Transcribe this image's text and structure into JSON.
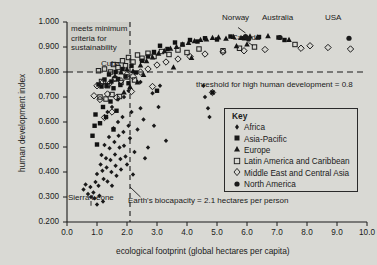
{
  "chart_data": {
    "type": "scatter",
    "title": "",
    "xlabel": "ecological footprint (global hectares per capita)",
    "ylabel": "human development index",
    "xlim": [
      0.0,
      10.0
    ],
    "ylim": [
      0.2,
      1.0
    ],
    "xticks": [
      "0.0",
      "1.0",
      "2.0",
      "3.0",
      "4.0",
      "5.0",
      "6.0",
      "7.0",
      "8.0",
      "9.0",
      "10.0"
    ],
    "yticks": [
      "1.000",
      "0.900",
      "0.800",
      "0.700",
      "0.600",
      "0.500",
      "0.400",
      "0.300",
      "0.200"
    ],
    "grid": false,
    "legend_position": "inside-bottom-right",
    "legend_title": "Key",
    "reference_lines": [
      {
        "name": "hdi-threshold",
        "orientation": "horizontal",
        "value": 0.8,
        "style": "dashed",
        "label": "threshold for high human development = 0.8"
      },
      {
        "name": "biocapacity",
        "orientation": "vertical",
        "value": 2.1,
        "style": "dashed",
        "label": "Earth's biocapacity = 2.1 hectares per person"
      }
    ],
    "annotations": [
      {
        "name": "sustainability-quadrant",
        "text": "meets minimum criteria for sustainability",
        "lines": [
          "meets minimum",
          "criteria for",
          "sustainability"
        ]
      },
      {
        "name": "cuba-callout",
        "text": "Cuba"
      },
      {
        "name": "sierra-leone-callout",
        "text": "Sierra Leone"
      },
      {
        "name": "norway-callout",
        "text": "Norway"
      },
      {
        "name": "canada-callout",
        "text": "Canada"
      },
      {
        "name": "australia-callout",
        "text": "Australia"
      },
      {
        "name": "usa-callout",
        "text": "USA"
      }
    ],
    "series": [
      {
        "name": "Africa",
        "marker": "small-diamond",
        "color": "#1a1a1a",
        "points": [
          [
            0.55,
            0.33
          ],
          [
            0.62,
            0.35
          ],
          [
            0.7,
            0.312
          ],
          [
            0.78,
            0.34
          ],
          [
            0.8,
            0.3
          ],
          [
            0.88,
            0.318
          ],
          [
            0.95,
            0.36
          ],
          [
            1.0,
            0.392
          ],
          [
            1.05,
            0.345
          ],
          [
            1.08,
            0.305
          ],
          [
            1.12,
            0.43
          ],
          [
            1.15,
            0.468
          ],
          [
            1.18,
            0.405
          ],
          [
            1.22,
            0.372
          ],
          [
            1.25,
            0.508
          ],
          [
            1.3,
            0.455
          ],
          [
            1.32,
            0.418
          ],
          [
            1.35,
            0.362
          ],
          [
            1.4,
            0.54
          ],
          [
            1.42,
            0.495
          ],
          [
            1.45,
            0.448
          ],
          [
            1.48,
            0.4
          ],
          [
            1.5,
            0.345
          ],
          [
            1.55,
            0.575
          ],
          [
            1.58,
            0.52
          ],
          [
            1.6,
            0.47
          ],
          [
            1.62,
            0.425
          ],
          [
            1.65,
            0.385
          ],
          [
            1.7,
            0.6
          ],
          [
            1.72,
            0.545
          ],
          [
            1.75,
            0.498
          ],
          [
            1.78,
            0.452
          ],
          [
            1.8,
            0.41
          ],
          [
            1.85,
            0.62
          ],
          [
            1.88,
            0.56
          ],
          [
            1.9,
            0.505
          ],
          [
            1.95,
            0.462
          ],
          [
            2.0,
            0.43
          ],
          [
            2.05,
            0.585
          ],
          [
            2.1,
            0.535
          ],
          [
            2.15,
            0.64
          ],
          [
            2.25,
            0.48
          ],
          [
            2.35,
            0.57
          ],
          [
            2.45,
            0.655
          ],
          [
            2.55,
            0.61
          ],
          [
            2.7,
            0.498
          ],
          [
            2.9,
            0.585
          ],
          [
            3.05,
            0.66
          ],
          [
            1.2,
            0.282
          ],
          [
            1.0,
            0.27
          ],
          [
            0.92,
            0.295
          ],
          [
            2.2,
            0.39
          ],
          [
            2.6,
            0.455
          ],
          [
            3.3,
            0.525
          ],
          [
            4.6,
            0.7
          ],
          [
            4.7,
            0.655
          ],
          [
            4.75,
            0.62
          ],
          [
            2.85,
            0.715
          ],
          [
            3.1,
            0.745
          ],
          [
            2.45,
            0.76
          ],
          [
            1.35,
            0.64
          ],
          [
            1.5,
            0.66
          ],
          [
            1.7,
            0.69
          ],
          [
            1.9,
            0.7
          ],
          [
            2.05,
            0.725
          ],
          [
            4.55,
            0.745
          ]
        ]
      },
      {
        "name": "Asia-Pacific",
        "marker": "filled-square",
        "color": "#111111",
        "points": [
          [
            1.05,
            0.75
          ],
          [
            1.15,
            0.742
          ],
          [
            1.25,
            0.77
          ],
          [
            1.32,
            0.745
          ],
          [
            1.4,
            0.79
          ],
          [
            1.48,
            0.762
          ],
          [
            1.55,
            0.735
          ],
          [
            1.62,
            0.8
          ],
          [
            1.7,
            0.772
          ],
          [
            1.78,
            0.748
          ],
          [
            1.85,
            0.812
          ],
          [
            1.95,
            0.782
          ],
          [
            2.05,
            0.755
          ],
          [
            2.15,
            0.825
          ],
          [
            2.3,
            0.798
          ],
          [
            2.5,
            0.845
          ],
          [
            2.7,
            0.862
          ],
          [
            2.9,
            0.88
          ],
          [
            3.1,
            0.905
          ],
          [
            3.35,
            0.892
          ],
          [
            3.6,
            0.918
          ],
          [
            3.85,
            0.91
          ],
          [
            4.1,
            0.928
          ],
          [
            4.35,
            0.922
          ],
          [
            4.6,
            0.935
          ],
          [
            5.0,
            0.93
          ],
          [
            5.45,
            0.942
          ],
          [
            5.9,
            0.935
          ],
          [
            6.4,
            0.94
          ],
          [
            7.05,
            0.938
          ],
          [
            7.25,
            0.928
          ],
          [
            0.95,
            0.63
          ],
          [
            1.1,
            0.595
          ],
          [
            1.2,
            0.66
          ],
          [
            1.3,
            0.62
          ],
          [
            1.45,
            0.682
          ],
          [
            1.55,
            0.57
          ],
          [
            1.65,
            0.645
          ],
          [
            0.85,
            0.545
          ],
          [
            0.92,
            0.585
          ],
          [
            1.0,
            0.51
          ],
          [
            4.85,
            0.718
          ],
          [
            3.0,
            0.725
          ]
        ]
      },
      {
        "name": "Europe",
        "marker": "filled-triangle",
        "color": "#141414",
        "points": [
          [
            1.6,
            0.785
          ],
          [
            1.8,
            0.8
          ],
          [
            2.0,
            0.812
          ],
          [
            2.2,
            0.805
          ],
          [
            2.45,
            0.828
          ],
          [
            2.65,
            0.845
          ],
          [
            2.85,
            0.86
          ],
          [
            3.05,
            0.875
          ],
          [
            3.25,
            0.885
          ],
          [
            3.45,
            0.895
          ],
          [
            3.65,
            0.902
          ],
          [
            3.85,
            0.912
          ],
          [
            4.05,
            0.918
          ],
          [
            4.25,
            0.925
          ],
          [
            4.45,
            0.93
          ],
          [
            4.65,
            0.932
          ],
          [
            4.85,
            0.938
          ],
          [
            5.05,
            0.94
          ],
          [
            5.3,
            0.935
          ],
          [
            5.55,
            0.942
          ],
          [
            5.8,
            0.938
          ],
          [
            6.1,
            0.944
          ],
          [
            6.35,
            0.94
          ],
          [
            6.7,
            0.945
          ],
          [
            7.4,
            0.93
          ],
          [
            2.35,
            0.76
          ],
          [
            2.1,
            0.742
          ],
          [
            1.9,
            0.72
          ],
          [
            5.65,
            0.905
          ],
          [
            6.0,
            0.912
          ],
          [
            4.15,
            0.858
          ],
          [
            3.55,
            0.82
          ],
          [
            2.55,
            0.79
          ]
        ]
      },
      {
        "name": "Latin America and Caribbean",
        "marker": "open-square",
        "color": "#1a1a1a",
        "points": [
          [
            1.05,
            0.805
          ],
          [
            1.25,
            0.812
          ],
          [
            1.45,
            0.8
          ],
          [
            1.55,
            0.83
          ],
          [
            1.7,
            0.818
          ],
          [
            1.85,
            0.845
          ],
          [
            1.95,
            0.825
          ],
          [
            2.05,
            0.858
          ],
          [
            2.2,
            0.84
          ],
          [
            2.35,
            0.868
          ],
          [
            2.5,
            0.855
          ],
          [
            2.7,
            0.875
          ],
          [
            2.9,
            0.862
          ],
          [
            3.15,
            0.882
          ],
          [
            3.4,
            0.87
          ],
          [
            3.7,
            0.888
          ],
          [
            4.0,
            0.878
          ],
          [
            4.4,
            0.892
          ],
          [
            5.2,
            0.885
          ],
          [
            5.75,
            0.895
          ],
          [
            1.15,
            0.762
          ],
          [
            1.35,
            0.745
          ],
          [
            1.6,
            0.772
          ],
          [
            1.8,
            0.758
          ],
          [
            2.0,
            0.78
          ],
          [
            2.25,
            0.768
          ],
          [
            1.1,
            0.7
          ],
          [
            1.3,
            0.692
          ],
          [
            1.5,
            0.71
          ],
          [
            1.75,
            0.702
          ],
          [
            6.25,
            0.9
          ],
          [
            7.6,
            0.91
          ]
        ]
      },
      {
        "name": "Middle East and Central Asia",
        "marker": "open-diamond",
        "color": "#1a1a1a",
        "points": [
          [
            1.0,
            0.745
          ],
          [
            1.2,
            0.76
          ],
          [
            1.4,
            0.752
          ],
          [
            1.6,
            0.775
          ],
          [
            1.8,
            0.765
          ],
          [
            2.0,
            0.79
          ],
          [
            2.2,
            0.782
          ],
          [
            2.45,
            0.8
          ],
          [
            2.7,
            0.812
          ],
          [
            3.0,
            0.828
          ],
          [
            3.3,
            0.84
          ],
          [
            3.7,
            0.852
          ],
          [
            4.1,
            0.862
          ],
          [
            4.6,
            0.872
          ],
          [
            5.2,
            0.88
          ],
          [
            5.9,
            0.885
          ],
          [
            6.6,
            0.89
          ],
          [
            7.8,
            0.895
          ],
          [
            8.7,
            0.898
          ],
          [
            9.45,
            0.892
          ],
          [
            0.9,
            0.705
          ],
          [
            1.1,
            0.69
          ],
          [
            1.35,
            0.712
          ],
          [
            1.65,
            0.698
          ],
          [
            4.85,
            0.718
          ],
          [
            1.5,
            0.64
          ],
          [
            1.25,
            0.618
          ],
          [
            8.1,
            0.905
          ],
          [
            2.85,
            0.742
          ],
          [
            2.15,
            0.722
          ]
        ]
      },
      {
        "name": "North America",
        "marker": "filled-circle",
        "color": "#1a1a1a",
        "points": [
          [
            5.95,
            0.942
          ],
          [
            6.05,
            0.932
          ],
          [
            7.1,
            0.938
          ],
          [
            9.4,
            0.935
          ]
        ]
      }
    ],
    "labeled_points": [
      {
        "country": "Norway",
        "footprint": 5.95,
        "hdi": 0.942,
        "series": "North America"
      },
      {
        "country": "Canada",
        "footprint": 6.05,
        "hdi": 0.932,
        "series": "North America"
      },
      {
        "country": "Australia",
        "footprint": 7.1,
        "hdi": 0.938,
        "series": "North America"
      },
      {
        "country": "USA",
        "footprint": 9.4,
        "hdi": 0.935,
        "series": "North America"
      },
      {
        "country": "Cuba",
        "footprint": 1.8,
        "hdi": 0.838,
        "series": "Latin America and Caribbean"
      },
      {
        "country": "Sierra Leone",
        "footprint": 0.8,
        "hdi": 0.3,
        "series": "Africa"
      }
    ]
  },
  "legend": {
    "title": "Key",
    "items": [
      {
        "label": "Africa",
        "marker": "small-diamond"
      },
      {
        "label": "Asia-Pacific",
        "marker": "filled-square"
      },
      {
        "label": "Europe",
        "marker": "filled-triangle"
      },
      {
        "label": "Latin America and Caribbean",
        "marker": "open-square"
      },
      {
        "label": "Middle East and Central Asia",
        "marker": "open-diamond"
      },
      {
        "label": "North America",
        "marker": "filled-circle"
      }
    ]
  },
  "colors": {
    "background": "#d9d9d4",
    "ink": "#1a1a1a",
    "axis": "#1a1a1a"
  }
}
